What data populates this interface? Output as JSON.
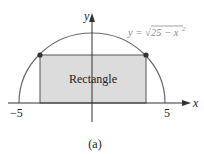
{
  "figure": {
    "caption": "(a)",
    "shape_label": "Rectangle",
    "equation": "y = √25 − x²",
    "equation_parts": {
      "lhs": "y = ",
      "radical": "√",
      "radicand": "25 − x",
      "exponent": "2"
    },
    "axes": {
      "x_label": "x",
      "y_label": "y",
      "x_ticks": [
        {
          "value": -5,
          "label": "−5"
        },
        {
          "value": 5,
          "label": "5"
        }
      ]
    },
    "colors": {
      "curve": "#6b6b6b",
      "rectangle_fill": "#dcdcdc",
      "axis": "#333333",
      "points": "#333333",
      "equation_text": "#8a8a8a"
    }
  }
}
